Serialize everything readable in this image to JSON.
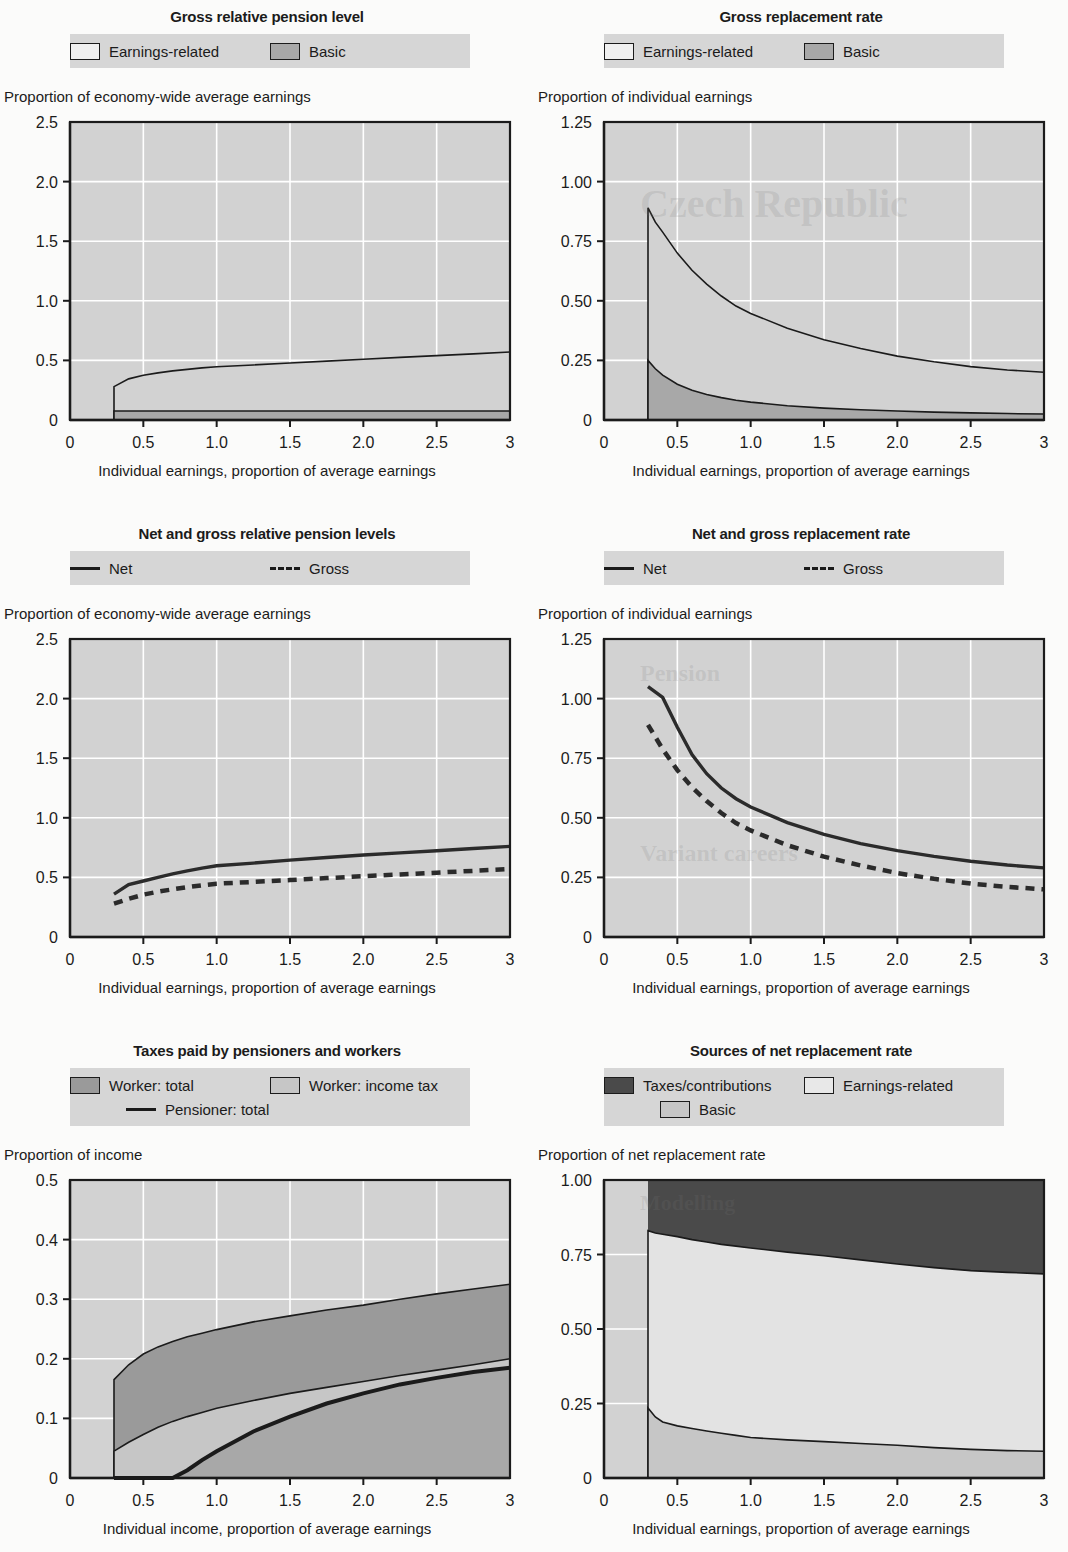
{
  "colors": {
    "plot_bg": "#d2d2d2",
    "grid": "#ffffff",
    "axis": "#1b1b1b",
    "earnings_related_fill": "#d2d2d2",
    "basic_fill": "#a8a8a8",
    "worker_total_fill": "#9a9a9a",
    "worker_incometax_fill": "#c6c6c6",
    "taxes_contributions_fill": "#4a4a4a",
    "legend_band": "#d6d6d6",
    "page_bg": "#fbfbfa"
  },
  "charts": [
    {
      "id": "gross-relative-pension-level",
      "title": "Gross relative pension level",
      "legend": [
        {
          "label": "Earnings-related",
          "style": "box",
          "fill": "#f0f0f0"
        },
        {
          "label": "Basic",
          "style": "box",
          "fill": "#a8a8a8"
        }
      ],
      "ylabel": "Proportion of economy-wide average earnings",
      "xlabel": "Individual earnings, proportion of average earnings",
      "yticks": [
        "2.5",
        "2.0",
        "1.5",
        "1.0",
        "0.5",
        "0"
      ],
      "xticks": [
        "0",
        "0.5",
        "1.0",
        "1.5",
        "2.0",
        "2.5",
        "3"
      ],
      "chart_data": {
        "type": "area",
        "title": "Gross relative pension level",
        "xlabel": "Individual earnings, proportion of average earnings",
        "ylabel": "Proportion of economy-wide average earnings",
        "xlim": [
          0,
          3
        ],
        "ylim": [
          0,
          2.5
        ],
        "grid": true,
        "legend_position": "top",
        "x": [
          0.3,
          0.4,
          0.5,
          0.6,
          0.7,
          0.8,
          0.9,
          1.0,
          1.25,
          1.5,
          1.75,
          2.0,
          2.25,
          2.5,
          2.75,
          3.0
        ],
        "series": [
          {
            "name": "Basic",
            "values": [
              0.075,
              0.075,
              0.075,
              0.075,
              0.075,
              0.075,
              0.075,
              0.075,
              0.075,
              0.075,
              0.075,
              0.075,
              0.075,
              0.075,
              0.075,
              0.075
            ]
          },
          {
            "name": "Earnings-related",
            "values": [
              0.28,
              0.345,
              0.375,
              0.395,
              0.412,
              0.425,
              0.437,
              0.447,
              0.462,
              0.478,
              0.494,
              0.51,
              0.525,
              0.54,
              0.555,
              0.57
            ]
          }
        ]
      }
    },
    {
      "id": "gross-replacement-rate",
      "title": "Gross replacement rate",
      "legend": [
        {
          "label": "Earnings-related",
          "style": "box",
          "fill": "#f0f0f0"
        },
        {
          "label": "Basic",
          "style": "box",
          "fill": "#a8a8a8"
        }
      ],
      "ylabel": "Proportion of individual earnings",
      "xlabel": "Individual earnings, proportion of average earnings",
      "yticks": [
        "1.25",
        "1.00",
        "0.75",
        "0.50",
        "0.25",
        "0"
      ],
      "xticks": [
        "0",
        "0.5",
        "1.0",
        "1.5",
        "2.0",
        "2.5",
        "3"
      ],
      "chart_data": {
        "type": "area",
        "title": "Gross replacement rate",
        "xlabel": "Individual earnings, proportion of average earnings",
        "ylabel": "Proportion of individual earnings",
        "xlim": [
          0,
          3
        ],
        "ylim": [
          0,
          1.25
        ],
        "grid": true,
        "legend_position": "top",
        "x": [
          0.3,
          0.35,
          0.4,
          0.5,
          0.6,
          0.7,
          0.8,
          0.9,
          1.0,
          1.25,
          1.5,
          1.75,
          2.0,
          2.25,
          2.5,
          2.75,
          3.0
        ],
        "series": [
          {
            "name": "Basic",
            "values": [
              0.25,
              0.215,
              0.188,
              0.15,
              0.125,
              0.107,
              0.094,
              0.083,
              0.075,
              0.06,
              0.05,
              0.043,
              0.038,
              0.033,
              0.03,
              0.027,
              0.025
            ]
          },
          {
            "name": "Earnings-related",
            "values": [
              0.89,
              0.83,
              0.788,
              0.7,
              0.628,
              0.57,
              0.52,
              0.478,
              0.447,
              0.385,
              0.337,
              0.3,
              0.268,
              0.244,
              0.224,
              0.21,
              0.2
            ]
          }
        ]
      }
    },
    {
      "id": "net-and-gross-relative-pension-levels",
      "title": "Net and gross relative pension levels",
      "legend": [
        {
          "label": "Net",
          "style": "line"
        },
        {
          "label": "Gross",
          "style": "dash"
        }
      ],
      "ylabel": "Proportion of economy-wide average earnings",
      "xlabel": "Individual earnings, proportion of average earnings",
      "yticks": [
        "2.5",
        "2.0",
        "1.5",
        "1.0",
        "0.5",
        "0"
      ],
      "xticks": [
        "0",
        "0.5",
        "1.0",
        "1.5",
        "2.0",
        "2.5",
        "3"
      ],
      "chart_data": {
        "type": "line",
        "title": "Net and gross relative pension levels",
        "xlabel": "Individual earnings, proportion of average earnings",
        "ylabel": "Proportion of economy-wide average earnings",
        "xlim": [
          0,
          3
        ],
        "ylim": [
          0,
          2.5
        ],
        "grid": true,
        "legend_position": "top",
        "x": [
          0.3,
          0.4,
          0.5,
          0.6,
          0.7,
          0.8,
          0.9,
          1.0,
          1.25,
          1.5,
          1.75,
          2.0,
          2.25,
          2.5,
          2.75,
          3.0
        ],
        "series": [
          {
            "name": "Net",
            "values": [
              0.36,
              0.44,
              0.47,
              0.5,
              0.53,
              0.555,
              0.578,
              0.598,
              0.62,
              0.645,
              0.667,
              0.688,
              0.706,
              0.724,
              0.742,
              0.76
            ]
          },
          {
            "name": "Gross",
            "values": [
              0.28,
              0.32,
              0.355,
              0.38,
              0.4,
              0.418,
              0.434,
              0.447,
              0.462,
              0.478,
              0.494,
              0.51,
              0.525,
              0.54,
              0.555,
              0.57
            ]
          }
        ]
      }
    },
    {
      "id": "net-and-gross-replacement-rate",
      "title": "Net and gross replacement rate",
      "legend": [
        {
          "label": "Net",
          "style": "line"
        },
        {
          "label": "Gross",
          "style": "dash"
        }
      ],
      "ylabel": "Proportion of individual earnings",
      "xlabel": "Individual earnings, proportion of average earnings",
      "yticks": [
        "1.25",
        "1.00",
        "0.75",
        "0.50",
        "0.25",
        "0"
      ],
      "xticks": [
        "0",
        "0.5",
        "1.0",
        "1.5",
        "2.0",
        "2.5",
        "3"
      ],
      "chart_data": {
        "type": "line",
        "title": "Net and gross replacement rate",
        "xlabel": "Individual earnings, proportion of average earnings",
        "ylabel": "Proportion of individual earnings",
        "xlim": [
          0,
          3
        ],
        "ylim": [
          0,
          1.25
        ],
        "grid": true,
        "legend_position": "top",
        "x": [
          0.3,
          0.4,
          0.5,
          0.6,
          0.7,
          0.8,
          0.9,
          1.0,
          1.25,
          1.5,
          1.75,
          2.0,
          2.25,
          2.5,
          2.75,
          3.0
        ],
        "series": [
          {
            "name": "Net",
            "values": [
              1.05,
              1.005,
              0.88,
              0.765,
              0.685,
              0.625,
              0.58,
              0.545,
              0.48,
              0.43,
              0.392,
              0.362,
              0.338,
              0.318,
              0.302,
              0.29
            ]
          },
          {
            "name": "Gross",
            "values": [
              0.89,
              0.788,
              0.7,
              0.628,
              0.57,
              0.52,
              0.478,
              0.447,
              0.385,
              0.337,
              0.3,
              0.268,
              0.244,
              0.224,
              0.21,
              0.2
            ]
          }
        ]
      }
    },
    {
      "id": "taxes-paid-by-pensioners-and-workers",
      "title": "Taxes paid by pensioners and workers",
      "legend": [
        {
          "label": "Worker: total",
          "style": "box",
          "fill": "#9a9a9a"
        },
        {
          "label": "Worker: income tax",
          "style": "box",
          "fill": "#c6c6c6"
        },
        {
          "label": "Pensioner: total",
          "style": "line"
        }
      ],
      "ylabel": "Proportion of income",
      "xlabel": "Individual income, proportion of average earnings",
      "yticks": [
        "0.5",
        "0.4",
        "0.3",
        "0.2",
        "0.1",
        "0"
      ],
      "xticks": [
        "0",
        "0.5",
        "1.0",
        "1.5",
        "2.0",
        "2.5",
        "3"
      ],
      "chart_data": {
        "type": "area",
        "title": "Taxes paid by pensioners and workers",
        "xlabel": "Individual income, proportion of average earnings",
        "ylabel": "Proportion of income",
        "xlim": [
          0,
          3
        ],
        "ylim": [
          0,
          0.5
        ],
        "grid": true,
        "legend_position": "top",
        "x": [
          0.3,
          0.4,
          0.5,
          0.6,
          0.7,
          0.8,
          0.9,
          1.0,
          1.25,
          1.5,
          1.75,
          2.0,
          2.25,
          2.5,
          2.75,
          3.0
        ],
        "series": [
          {
            "name": "Worker: total",
            "values": [
              0.165,
              0.19,
              0.208,
              0.22,
              0.229,
              0.237,
              0.243,
              0.249,
              0.262,
              0.272,
              0.282,
              0.29,
              0.3,
              0.309,
              0.317,
              0.325
            ]
          },
          {
            "name": "Worker: income tax",
            "values": [
              0.045,
              0.06,
              0.073,
              0.085,
              0.095,
              0.103,
              0.11,
              0.117,
              0.13,
              0.142,
              0.152,
              0.162,
              0.172,
              0.181,
              0.19,
              0.2
            ]
          },
          {
            "name": "Pensioner: total",
            "values": [
              0.0,
              0.0,
              0.0,
              0.0,
              0.0,
              0.013,
              0.03,
              0.045,
              0.078,
              0.103,
              0.125,
              0.142,
              0.157,
              0.168,
              0.178,
              0.185
            ]
          }
        ]
      }
    },
    {
      "id": "sources-of-net-replacement-rate",
      "title": "Sources of net replacement rate",
      "legend": [
        {
          "label": "Taxes/contributions",
          "style": "box",
          "fill": "#4a4a4a"
        },
        {
          "label": "Earnings-related",
          "style": "box",
          "fill": "#e8e8e8"
        },
        {
          "label": "Basic",
          "style": "box",
          "fill": "#c6c6c6"
        }
      ],
      "ylabel": "Proportion of net replacement rate",
      "xlabel": "Individual earnings, proportion of average earnings",
      "yticks": [
        "1.00",
        "0.75",
        "0.50",
        "0.25",
        "0"
      ],
      "xticks": [
        "0",
        "0.5",
        "1.0",
        "1.5",
        "2.0",
        "2.5",
        "3"
      ],
      "chart_data": {
        "type": "area",
        "title": "Sources of net replacement rate",
        "xlabel": "Individual earnings, proportion of average earnings",
        "ylabel": "Proportion of net replacement rate",
        "xlim": [
          0,
          3
        ],
        "ylim": [
          0,
          1.0
        ],
        "grid": true,
        "legend_position": "top",
        "stacked": true,
        "x": [
          0.3,
          0.35,
          0.4,
          0.5,
          0.6,
          0.7,
          0.8,
          0.9,
          1.0,
          1.25,
          1.5,
          1.75,
          2.0,
          2.25,
          2.5,
          2.75,
          3.0
        ],
        "series": [
          {
            "name": "Basic",
            "values": [
              0.235,
              0.205,
              0.188,
              0.175,
              0.166,
              0.158,
              0.15,
              0.143,
              0.136,
              0.128,
              0.122,
              0.116,
              0.11,
              0.102,
              0.096,
              0.092,
              0.09
            ]
          },
          {
            "name": "Earnings-related cumulative",
            "values": [
              0.83,
              0.822,
              0.818,
              0.81,
              0.8,
              0.792,
              0.784,
              0.778,
              0.772,
              0.758,
              0.746,
              0.732,
              0.718,
              0.706,
              0.696,
              0.69,
              0.685
            ]
          },
          {
            "name": "Taxes/contributions cumulative",
            "values": [
              1.0,
              1.0,
              1.0,
              1.0,
              1.0,
              1.0,
              1.0,
              1.0,
              1.0,
              1.0,
              1.0,
              1.0,
              1.0,
              1.0,
              1.0,
              1.0,
              1.0
            ]
          }
        ]
      }
    }
  ],
  "ghost_text": {
    "header": "Czech Republic",
    "items": [
      "Pension",
      "Variant careers",
      "Modelling"
    ]
  }
}
